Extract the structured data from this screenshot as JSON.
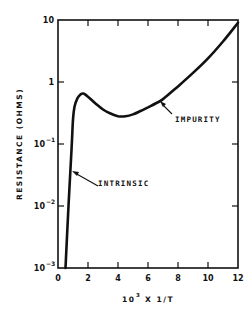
{
  "chart_data": {
    "type": "line",
    "title": "",
    "xlabel": "10^3 X 1/T",
    "ylabel": "RESISTANCE (OHMS)",
    "xlim": [
      0,
      12
    ],
    "ylim": [
      0.001,
      10
    ],
    "yscale": "log",
    "grid": false,
    "x_ticks": [
      0,
      2,
      4,
      6,
      8,
      10,
      12
    ],
    "x_tick_labels": [
      "0",
      "2",
      "4",
      "6",
      "8",
      "10",
      "12"
    ],
    "y_ticks": [
      0.001,
      0.01,
      0.1,
      1,
      10
    ],
    "y_tick_labels": [
      "10^-3",
      "10^-2",
      "10^-1",
      "1",
      "10"
    ],
    "series": [
      {
        "name": "Resistance",
        "x": [
          0.5,
          0.7,
          0.9,
          1.0,
          1.1,
          1.3,
          1.5,
          1.7,
          2.0,
          2.5,
          3.0,
          3.5,
          4.0,
          4.5,
          5.0,
          5.5,
          6.0,
          6.5,
          7.0,
          8.0,
          9.0,
          10.0,
          11.0,
          12.0
        ],
        "values": [
          0.001,
          0.01,
          0.08,
          0.25,
          0.4,
          0.55,
          0.63,
          0.65,
          0.58,
          0.45,
          0.36,
          0.31,
          0.28,
          0.28,
          0.3,
          0.34,
          0.39,
          0.45,
          0.53,
          0.85,
          1.4,
          2.4,
          4.5,
          9.0
        ]
      }
    ],
    "annotations": [
      {
        "text": "INTRINSIC",
        "points_to": {
          "x": 0.9,
          "y": 0.04
        }
      },
      {
        "text": "IMPURITY",
        "points_to": {
          "x": 7.0,
          "y": 0.52
        }
      }
    ]
  },
  "labels": {
    "ylabel": "RESISTANCE (OHMS)",
    "xlabel_base": "10",
    "xlabel_exp": "3",
    "xlabel_rest": " X 1/T",
    "ytick_10": "10",
    "ytick_1": "1",
    "ytick_m1_base": "10",
    "ytick_m1_exp": "−1",
    "ytick_m2_base": "10",
    "ytick_m2_exp": "−2",
    "ytick_m3_base": "10",
    "ytick_m3_exp": "−3",
    "xtick_0": "0",
    "xtick_2": "2",
    "xtick_4": "4",
    "xtick_6": "6",
    "xtick_8": "8",
    "xtick_10": "10",
    "xtick_12": "12",
    "annot_intrinsic": "INTRINSIC",
    "annot_impurity": "IMPURITY"
  }
}
